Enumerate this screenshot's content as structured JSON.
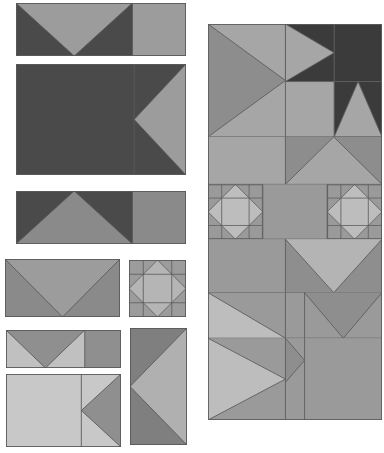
{
  "canvas": {
    "width": 384,
    "height": 453,
    "background": "#ffffff",
    "title": "Quilt Block Layout"
  },
  "palette": {
    "very_dark": "#3a3a3a",
    "dark": "#4a4a4a",
    "mid_dark": "#6f6f6f",
    "mid": "#8a8a8a",
    "mid_light": "#9c9c9c",
    "light": "#b5b5b5",
    "very_light": "#c8c8c8",
    "outline": "#5a5a5a",
    "outline_light": "#808080"
  },
  "left_column": {
    "label": "Component blocks",
    "blocks": [
      {
        "name": "flying-geese-with-square-dark",
        "pattern": "geese-down-plus-square",
        "x": 16,
        "y": 3,
        "width": 170,
        "height": 53,
        "bg": "#4a4a4a",
        "fg": "#9c9c9c",
        "split": 0.685
      },
      {
        "name": "half-square-triangle-point-left-dark",
        "pattern": "point-left-plus-field",
        "x": 16,
        "y": 64,
        "width": 170,
        "height": 111,
        "bg": "#4a4a4a",
        "fg": "#9c9c9c",
        "split": 0.695
      },
      {
        "name": "flying-geese-up-with-square-dark",
        "pattern": "geese-up-plus-square",
        "x": 16,
        "y": 191,
        "width": 170,
        "height": 53,
        "bg": "#4a4a4a",
        "fg": "#8a8a8a",
        "split": 0.685
      },
      {
        "name": "flying-geese-down-medium",
        "pattern": "geese-down-full",
        "x": 5,
        "y": 259,
        "width": 115,
        "height": 58,
        "bg": "#9c9c9c",
        "fg": "#8a8a8a",
        "split": 1.0
      },
      {
        "name": "sawtooth-star-small",
        "pattern": "sawtooth-star",
        "x": 129,
        "y": 260,
        "width": 57,
        "height": 57,
        "bg": "#9c9c9c",
        "fg": "#b5b5b5",
        "accent": "#8a8a8a"
      },
      {
        "name": "flying-geese-with-square-light",
        "pattern": "geese-down-plus-square",
        "x": 6,
        "y": 330,
        "width": 115,
        "height": 38,
        "bg": "#c0c0c0",
        "fg": "#8f8f8f",
        "split": 0.685
      },
      {
        "name": "half-square-triangle-point-left-light",
        "pattern": "point-left-plus-field",
        "x": 6,
        "y": 374,
        "width": 115,
        "height": 73,
        "bg": "#c8c8c8",
        "fg": "#8f8f8f",
        "split": 0.655
      },
      {
        "name": "half-square-triangle-point-left-tall",
        "pattern": "point-left-vertical",
        "x": 130,
        "y": 328,
        "width": 57,
        "height": 117,
        "bg": "#7f7f7f",
        "fg": "#b0b0b0"
      }
    ]
  },
  "right_panel": {
    "label": "Assembled quilt top",
    "x": 208,
    "y": 24,
    "width": 174,
    "height": 396,
    "rows": [
      {
        "name": "row-top-star-corner",
        "cells": [
          {
            "name": "hst-point-right-large",
            "fill_bg": "#a0a0a0",
            "fill_fg": "#8a8a8a"
          },
          {
            "name": "flying-geese-point-right",
            "fill_bg": "#3a3a3a",
            "fill_fg": "#a8a8a8"
          },
          {
            "name": "dark-square",
            "fill_bg": "#3a3a3a"
          },
          {
            "name": "light-square",
            "fill_bg": "#a8a8a8"
          },
          {
            "name": "flying-geese-up-dark",
            "fill_bg": "#3a3a3a",
            "fill_fg": "#a8a8a8"
          }
        ]
      },
      {
        "name": "row-second",
        "cells": [
          {
            "name": "plain-light-square",
            "fill_bg": "#a8a8a8"
          },
          {
            "name": "flying-geese-up-wide",
            "fill_bg": "#8a8a8a",
            "fill_fg": "#a8a8a8"
          }
        ]
      },
      {
        "name": "row-star-band",
        "cells": [
          {
            "name": "sawtooth-star-left",
            "fill_bg": "#9a9a9a",
            "fill_fg": "#bcbcbc"
          },
          {
            "name": "plain-medium-square",
            "fill_bg": "#9a9a9a"
          },
          {
            "name": "sawtooth-star-right",
            "fill_bg": "#9a9a9a",
            "fill_fg": "#bcbcbc"
          }
        ]
      },
      {
        "name": "row-fourth",
        "cells": [
          {
            "name": "plain-medium-square-left",
            "fill_bg": "#9a9a9a"
          },
          {
            "name": "flying-geese-down-wide",
            "fill_bg": "#b4b4b4",
            "fill_fg": "#8e8e8e"
          }
        ]
      },
      {
        "name": "row-fifth",
        "cells": [
          {
            "name": "hst-point-right-light",
            "fill_bg": "#9a9a9a",
            "fill_fg": "#bcbcbc"
          },
          {
            "name": "plain-medium-square-mid",
            "fill_bg": "#9a9a9a"
          },
          {
            "name": "flying-geese-down-small",
            "fill_bg": "#9a9a9a",
            "fill_fg": "#8e8e8e"
          }
        ]
      },
      {
        "name": "row-bottom",
        "cells": [
          {
            "name": "hst-point-right-bottom",
            "fill_bg": "#9a9a9a",
            "fill_fg": "#bcbcbc"
          },
          {
            "name": "flying-geese-point-right-bottom",
            "fill_bg": "#9a9a9a",
            "fill_fg": "#8e8e8e"
          },
          {
            "name": "plain-square-bottom-right",
            "fill_bg": "#9a9a9a"
          }
        ]
      }
    ]
  }
}
